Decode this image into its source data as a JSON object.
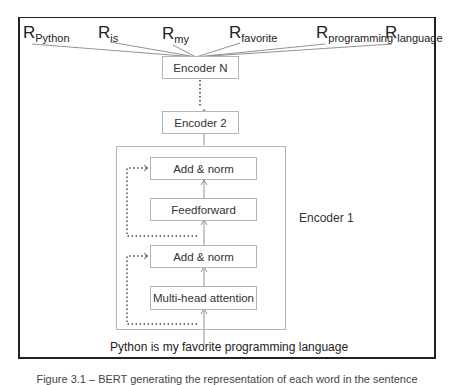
{
  "top_clipped_text": "",
  "representations": [
    {
      "base": "R",
      "sub": "Python"
    },
    {
      "base": "R",
      "sub": "is"
    },
    {
      "base": "R",
      "sub": "my"
    },
    {
      "base": "R",
      "sub": "favorite"
    },
    {
      "base": "R",
      "sub": "programming"
    },
    {
      "base": "R",
      "sub": "language"
    }
  ],
  "encoders": {
    "encoder_n": "Encoder N",
    "encoder_2": "Encoder 2",
    "encoder_1_label": "Encoder 1"
  },
  "encoder_1_layers": {
    "add_norm_top": "Add & norm",
    "feedforward": "Feedforward",
    "add_norm_bottom": "Add & norm",
    "multi_head_attention": "Multi-head attention"
  },
  "input_sentence": "Python is my favorite programming language",
  "caption": "Figure 3.1 – BERT generating the representation of each word in the sentence",
  "colors": {
    "frame": "#222222",
    "box_border": "#b5b5b5",
    "line": "#777777",
    "dotted": "#444444"
  }
}
